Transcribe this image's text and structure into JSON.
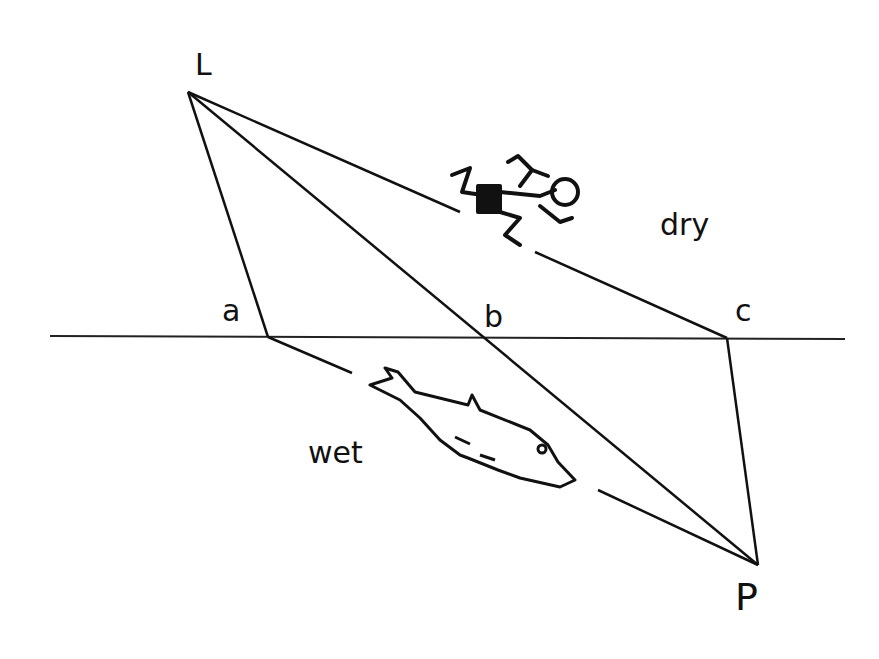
{
  "diagram": {
    "labels": {
      "L": "L",
      "a": "a",
      "b": "b",
      "c": "c",
      "P": "P",
      "dry": "dry",
      "wet": "wet"
    },
    "points": {
      "L": [
        188,
        92
      ],
      "a": [
        268,
        337
      ],
      "b": [
        485,
        338
      ],
      "c": [
        727,
        338
      ],
      "P": [
        758,
        565
      ]
    },
    "regions": [
      "dry",
      "wet"
    ],
    "figures": [
      "running-person",
      "dolphin"
    ],
    "stroke_color": "#111111"
  }
}
